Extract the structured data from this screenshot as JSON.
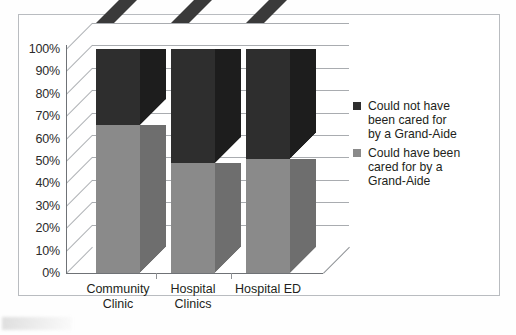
{
  "chart_data": {
    "type": "bar",
    "title": "",
    "subtitle": "",
    "xlabel": "",
    "ylabel": "",
    "stacked": true,
    "stack_mode": "percent",
    "three_d": true,
    "grid": true,
    "legend_position": "right",
    "ylim": [
      0,
      100
    ],
    "ytick_labels": [
      "100%",
      "90%",
      "80%",
      "70%",
      "60%",
      "50%",
      "40%",
      "30%",
      "20%",
      "10%",
      "0%"
    ],
    "ytick_values": [
      100,
      90,
      80,
      70,
      60,
      50,
      40,
      30,
      20,
      10,
      0
    ],
    "categories": [
      "Community Clinic",
      "Hospital Clinics",
      "Hospital ED"
    ],
    "category_lines": [
      [
        "Community",
        "Clinic"
      ],
      [
        "Hospital",
        "Clinics"
      ],
      [
        "Hospital ED",
        ""
      ]
    ],
    "series": [
      {
        "name": "Could have been cared for by a Grand-Aide",
        "legend_lines": [
          "Could have been",
          "cared for by a",
          "Grand-Aide"
        ],
        "color": "#8a8a8a",
        "side_color": "#6e6e6e",
        "values": [
          66,
          49,
          51
        ]
      },
      {
        "name": "Could not have been cared for by a Grand-Aide",
        "legend_lines": [
          "Could not have",
          "been cared for",
          "by a Grand-Aide"
        ],
        "color": "#2e2e2e",
        "side_color": "#1d1d1d",
        "top_color": "#3a3a3a",
        "values": [
          34,
          51,
          49
        ]
      }
    ]
  }
}
